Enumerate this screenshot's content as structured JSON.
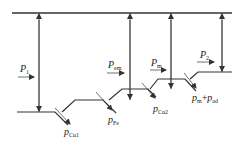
{
  "diagram": {
    "type": "power-flow",
    "stroke_color": "#333333",
    "labels": {
      "p1": {
        "main": "P",
        "sub": "1"
      },
      "pem": {
        "main": "P",
        "sub": "em"
      },
      "pm": {
        "main": "P",
        "sub": "m"
      },
      "p2": {
        "main": "P",
        "sub": "2"
      },
      "pcu1": {
        "main": "p",
        "sub": "Cu1"
      },
      "pfe": {
        "main": "p",
        "sub": "Fe"
      },
      "pcu2": {
        "main": "p",
        "sub": "Cu2"
      },
      "pm_pad": {
        "main1": "p",
        "sub1": "m",
        "plus": "+",
        "main2": "p",
        "sub2": "ad"
      }
    }
  }
}
